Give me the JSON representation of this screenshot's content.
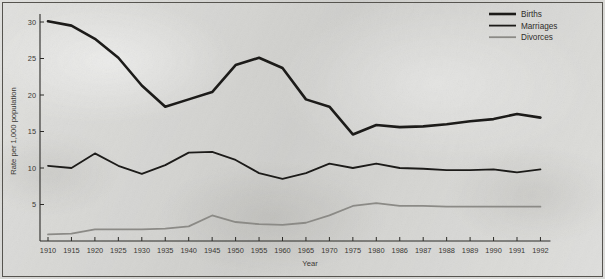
{
  "chart_data": {
    "type": "line",
    "title": "",
    "xlabel": "Year",
    "ylabel": "Rate per 1,000 population",
    "categories": [
      "1910",
      "1915",
      "1920",
      "1925",
      "1930",
      "1935",
      "1940",
      "1945",
      "1950",
      "1955",
      "1960",
      "1965",
      "1970",
      "1975",
      "1980",
      "1986",
      "1987",
      "1988",
      "1989",
      "1990",
      "1991",
      "1992"
    ],
    "ylim": [
      0,
      32
    ],
    "yticks": [
      5,
      10,
      15,
      20,
      25,
      30
    ],
    "xtick_labels": [
      "1910",
      "1915",
      "1920",
      "1925",
      "1930",
      "1935",
      "1940",
      "1945",
      "1950",
      "1955",
      "1960",
      "1965",
      "1970",
      "1975",
      "1980",
      "1986",
      "1987",
      "1988",
      "1989",
      "1990",
      "1991",
      "1992"
    ],
    "grid": false,
    "legend_position": "top-right",
    "series": [
      {
        "name": "Births",
        "color": "#1c1b19",
        "width": 2.6,
        "values": [
          30.1,
          29.5,
          27.7,
          25.1,
          21.3,
          18.4,
          19.4,
          20.4,
          24.1,
          25.1,
          23.7,
          19.4,
          18.4,
          14.6,
          15.9,
          15.6,
          15.7,
          16.0,
          16.4,
          16.7,
          17.4,
          16.9
        ]
      },
      {
        "name": "Marriages",
        "color": "#1c1b19",
        "width": 1.8,
        "values": [
          10.3,
          10.0,
          12.0,
          10.3,
          9.2,
          10.4,
          12.1,
          12.2,
          11.1,
          9.3,
          8.5,
          9.3,
          10.6,
          10.0,
          10.6,
          10.0,
          9.9,
          9.7,
          9.7,
          9.8,
          9.4,
          9.8
        ]
      },
      {
        "name": "Divorces",
        "color": "#8b8a86",
        "width": 1.8,
        "values": [
          0.9,
          1.0,
          1.6,
          1.6,
          1.6,
          1.7,
          2.0,
          3.5,
          2.6,
          2.3,
          2.2,
          2.5,
          3.5,
          4.8,
          5.2,
          4.8,
          4.8,
          4.7,
          4.7,
          4.7,
          4.7,
          4.7
        ]
      }
    ]
  },
  "legend": {
    "entries": [
      {
        "label": "Births"
      },
      {
        "label": "Marriages"
      },
      {
        "label": "Divorces"
      }
    ]
  },
  "axes": {
    "y_title": "Rate per 1,000 population",
    "x_title": "Year"
  }
}
